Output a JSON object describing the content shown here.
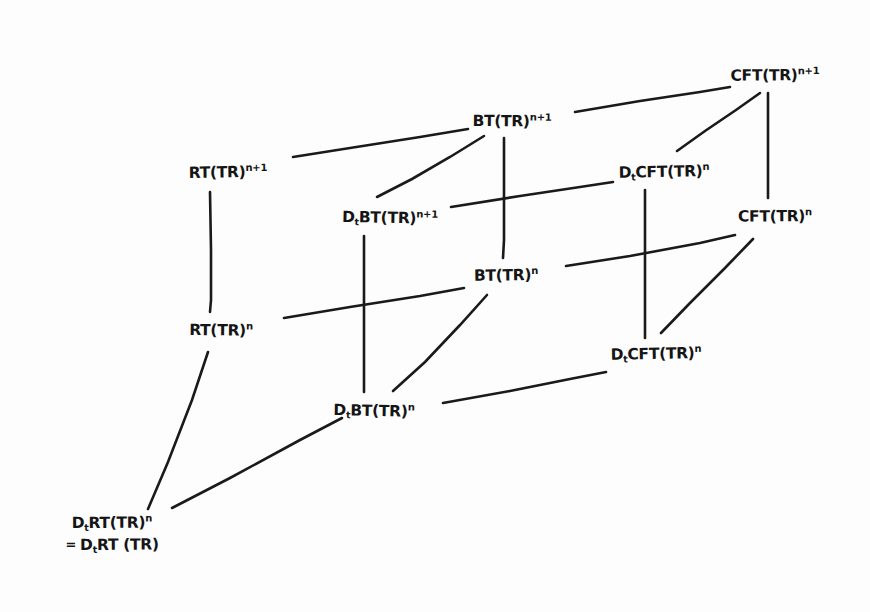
{
  "diagram": {
    "stroke_color": "#1a1a1a",
    "background_color": "#fdfdfd",
    "width": 870,
    "height": 612,
    "nodes": [
      {
        "id": "rt_n1",
        "base": "RT(TR)",
        "sup": "n+1",
        "sub": "",
        "x": 228,
        "y": 172
      },
      {
        "id": "bt_n1",
        "base": "BT(TR)",
        "sup": "n+1",
        "sub": "",
        "x": 512,
        "y": 121
      },
      {
        "id": "cft_n1",
        "base": "CFT(TR)",
        "sup": "n+1",
        "sub": "",
        "x": 775,
        "y": 75
      },
      {
        "id": "dt_bt_n1",
        "base": "BT(TR)",
        "sup": "n+1",
        "sub": "t",
        "prefix": "D",
        "x": 390,
        "y": 218
      },
      {
        "id": "dt_cft_n",
        "base": "CFT(TR)",
        "sup": "n",
        "sub": "t",
        "prefix": "D",
        "x": 664,
        "y": 172
      },
      {
        "id": "bt_n",
        "base": "BT(TR)",
        "sup": "n",
        "sub": "",
        "x": 506,
        "y": 275
      },
      {
        "id": "cft_n",
        "base": "CFT(TR)",
        "sup": "n",
        "sub": "",
        "x": 775,
        "y": 216
      },
      {
        "id": "rt_n",
        "base": "RT(TR)",
        "sup": "n",
        "sub": "",
        "x": 221,
        "y": 330
      },
      {
        "id": "dt_bt_n",
        "base": "BT(TR)",
        "sup": "n",
        "sub": "t",
        "prefix": "D",
        "x": 374,
        "y": 411
      },
      {
        "id": "dt_cft_n2",
        "base": "CFT(TR)",
        "sup": "n",
        "sub": "t",
        "prefix": "D",
        "x": 656,
        "y": 354
      },
      {
        "id": "dt_rt_n",
        "base": "RT(TR)",
        "sup": "n",
        "sub": "t",
        "prefix": "D",
        "eq_prefix": "=",
        "eq_base": "RT (TR)",
        "eq_sub": "t",
        "eq_lead": "D",
        "x": 112,
        "y": 534
      }
    ],
    "edges": [
      {
        "from": "rt_n1",
        "to": "bt_n1",
        "kind": "top-horizontal"
      },
      {
        "from": "bt_n1",
        "to": "cft_n1",
        "kind": "top-horizontal"
      },
      {
        "from": "dt_bt_n1",
        "to": "bt_n1",
        "kind": "diagonal"
      },
      {
        "from": "dt_bt_n1",
        "to": "dt_cft_n",
        "kind": "horizontal"
      },
      {
        "from": "dt_cft_n",
        "to": "cft_n1",
        "kind": "diagonal"
      },
      {
        "from": "rt_n1",
        "to": "rt_n",
        "kind": "vertical"
      },
      {
        "from": "bt_n1",
        "to": "bt_n",
        "kind": "vertical"
      },
      {
        "from": "cft_n1",
        "to": "cft_n",
        "kind": "vertical"
      },
      {
        "from": "dt_bt_n1",
        "to": "dt_bt_n",
        "kind": "vertical"
      },
      {
        "from": "dt_cft_n",
        "to": "dt_cft_n2",
        "kind": "vertical"
      },
      {
        "from": "rt_n",
        "to": "bt_n",
        "kind": "horizontal"
      },
      {
        "from": "bt_n",
        "to": "cft_n",
        "kind": "horizontal"
      },
      {
        "from": "dt_bt_n",
        "to": "bt_n",
        "kind": "diagonal"
      },
      {
        "from": "dt_bt_n",
        "to": "dt_cft_n2",
        "kind": "horizontal"
      },
      {
        "from": "dt_cft_n2",
        "to": "cft_n",
        "kind": "diagonal"
      },
      {
        "from": "dt_rt_n",
        "to": "rt_n",
        "kind": "diagonal"
      },
      {
        "from": "dt_rt_n",
        "to": "dt_bt_n",
        "kind": "diagonal"
      }
    ]
  }
}
